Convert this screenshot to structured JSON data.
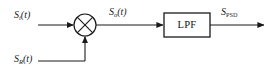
{
  "diagram": {
    "type": "block-diagram",
    "stroke_color": "#1a1a1a",
    "background_color": "#ffffff",
    "labels": {
      "input_signal": {
        "base": "S",
        "subscript": "i",
        "argument": "(t)"
      },
      "reference_signal": {
        "base": "S",
        "subscript": "R",
        "argument": "(t)"
      },
      "mixer_output": {
        "base": "S",
        "subscript": "o",
        "argument": "(t)"
      },
      "final_output": {
        "base": "S",
        "subscript": "PSD",
        "argument": ""
      },
      "filter_block": "LPF"
    },
    "nodes": [
      {
        "name": "mixer",
        "shape": "circle-with-x",
        "cx": 85,
        "cy": 25,
        "r": 11
      },
      {
        "name": "low-pass-filter",
        "shape": "rectangle",
        "x": 164,
        "y": 13,
        "w": 46,
        "h": 24
      }
    ],
    "connections": [
      {
        "from": "input_signal",
        "to": "mixer",
        "direction": "right"
      },
      {
        "from": "reference_signal",
        "to": "mixer",
        "direction": "up"
      },
      {
        "from": "mixer",
        "to": "low-pass-filter",
        "direction": "right"
      },
      {
        "from": "low-pass-filter",
        "to": "final_output",
        "direction": "right"
      }
    ]
  }
}
